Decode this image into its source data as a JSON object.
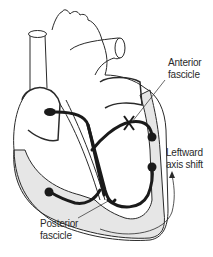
{
  "diagram": {
    "labels": {
      "anterior_fascicle": {
        "line1": "Anterior",
        "line2": "fascicle"
      },
      "leftward_axis_shift": {
        "line1": "Leftward",
        "line2": "axis shift"
      },
      "posterior_fascicle": {
        "line1": "Posterior",
        "line2": "fascicle"
      }
    },
    "annotations": {
      "block_marker": "X on anterior fascicle",
      "arrow": "curved arrow indicating leftward axis shift"
    },
    "colors": {
      "outline": "#2a2a2a",
      "conduction_pathway": "#1a1a1a",
      "myocardium_fill": "#e6e6e6",
      "background": "#ffffff"
    }
  }
}
